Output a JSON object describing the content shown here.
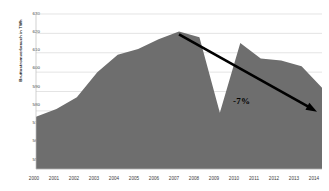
{
  "chart_data": {
    "type": "area",
    "title": "",
    "subtitle": "",
    "xlabel": "",
    "ylabel": "Bruttostromverbrauch in TWh",
    "categories": [
      "2000",
      "2001",
      "2002",
      "2003",
      "2004",
      "2005",
      "2006",
      "2007",
      "2008",
      "2009",
      "2010",
      "2011",
      "2012",
      "2013",
      "2014"
    ],
    "values": [
      577,
      581,
      587,
      600,
      609,
      612,
      617,
      621,
      618,
      579,
      615,
      607,
      606,
      603,
      592
    ],
    "series": [
      {
        "name": "Bruttostromverbrauch",
        "values": [
          577,
          581,
          587,
          600,
          609,
          612,
          617,
          621,
          618,
          579,
          615,
          607,
          606,
          603,
          592
        ]
      }
    ],
    "ylim": [
      550,
      630
    ],
    "yticks": [
      550,
      560,
      570,
      580,
      590,
      600,
      610,
      620,
      630
    ],
    "ytick_labels": [
      "550",
      "560",
      "570",
      "580",
      "590",
      "600",
      "610",
      "620",
      "630"
    ],
    "xlim": [
      "2000",
      "2014"
    ],
    "grid": true,
    "grid_axis": "y",
    "legend": false,
    "legend_position": "none",
    "area_color": "#6e6e6e",
    "grid_color": "#d9d9d9",
    "axis_color": "#bdbdbd",
    "annotations": [
      {
        "text": "-7%",
        "kind": "arrow-label",
        "color": "#000000",
        "arrow_from_year": "2007",
        "arrow_from_value": 621,
        "arrow_to_year": "2014",
        "arrow_to_value": 592
      }
    ]
  },
  "axes": {
    "y_axis_title": "Bruttostromverbrauch in TWh",
    "y_ticks": [
      "630",
      "620",
      "610",
      "600",
      "590",
      "580",
      "570",
      "560",
      "550"
    ],
    "x_ticks": [
      "2000",
      "2001",
      "2002",
      "2003",
      "2004",
      "2005",
      "2006",
      "2007",
      "2008",
      "2009",
      "2010",
      "2011",
      "2012",
      "2013",
      "2014"
    ]
  },
  "annotation": {
    "percent_label": "-7%"
  }
}
